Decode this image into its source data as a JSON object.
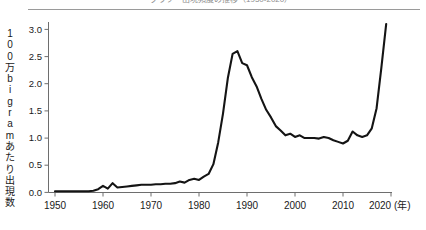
{
  "figure": {
    "background_color": "#ffffff",
    "line_color": "#141414",
    "axis_color": "#6e6e6e",
    "top_cropped_caption": "グラフ　出現頻度の推移（1950-2020）"
  },
  "axis": {
    "y_title_chars": [
      "1",
      "0",
      "0",
      "万",
      "b",
      "i",
      "g",
      "r",
      "a",
      "m",
      "あ",
      "た",
      "り",
      "出",
      "現",
      "数"
    ],
    "y_title_text": "100万bigramあたり出現数",
    "y_ticks": [
      "0.0",
      "0.5",
      "1.0",
      "1.5",
      "2.0",
      "2.5",
      "3.0"
    ],
    "x_ticks": [
      "1950",
      "1960",
      "1970",
      "1980",
      "1990",
      "2000",
      "2010",
      "2020"
    ],
    "x_unit_label": "(年)"
  },
  "chart_data": {
    "type": "line",
    "title": "",
    "xlabel": "年",
    "ylabel": "100万bigramあたり出現数",
    "xlim": [
      1950,
      2020
    ],
    "ylim": [
      0.0,
      3.2
    ],
    "yticks": [
      0.0,
      0.5,
      1.0,
      1.5,
      2.0,
      2.5,
      3.0
    ],
    "xticks": [
      1950,
      1960,
      1970,
      1980,
      1990,
      2000,
      2010,
      2020
    ],
    "grid": false,
    "legend": "none",
    "series": [
      {
        "name": "出現頻度",
        "x": [
          1950,
          1951,
          1952,
          1953,
          1954,
          1955,
          1956,
          1957,
          1958,
          1959,
          1960,
          1961,
          1962,
          1963,
          1964,
          1965,
          1966,
          1967,
          1968,
          1969,
          1970,
          1971,
          1972,
          1973,
          1974,
          1975,
          1976,
          1977,
          1978,
          1979,
          1980,
          1981,
          1982,
          1983,
          1984,
          1985,
          1986,
          1987,
          1988,
          1989,
          1990,
          1991,
          1992,
          1993,
          1994,
          1995,
          1996,
          1997,
          1998,
          1999,
          2000,
          2001,
          2002,
          2003,
          2004,
          2005,
          2006,
          2007,
          2008,
          2009,
          2010,
          2011,
          2012,
          2013,
          2014,
          2015,
          2016,
          2017,
          2018,
          2019
        ],
        "values": [
          0.02,
          0.02,
          0.02,
          0.02,
          0.02,
          0.02,
          0.02,
          0.02,
          0.03,
          0.06,
          0.12,
          0.07,
          0.17,
          0.09,
          0.1,
          0.11,
          0.12,
          0.13,
          0.14,
          0.14,
          0.14,
          0.15,
          0.15,
          0.16,
          0.16,
          0.17,
          0.2,
          0.18,
          0.23,
          0.25,
          0.23,
          0.29,
          0.34,
          0.52,
          0.92,
          1.45,
          2.1,
          2.55,
          2.6,
          2.38,
          2.34,
          2.12,
          1.95,
          1.72,
          1.52,
          1.38,
          1.22,
          1.14,
          1.05,
          1.08,
          1.02,
          1.05,
          1.0,
          1.0,
          1.0,
          0.99,
          1.02,
          1.0,
          0.96,
          0.93,
          0.9,
          0.95,
          1.12,
          1.05,
          1.02,
          1.05,
          1.18,
          1.55,
          2.3,
          3.1
        ]
      }
    ]
  }
}
